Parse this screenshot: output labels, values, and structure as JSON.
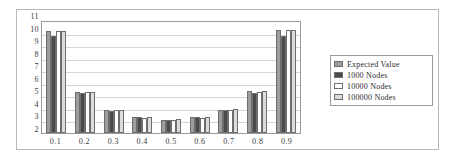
{
  "chart_data": {
    "type": "bar",
    "title": "",
    "subtitle": "",
    "xlabel": "",
    "ylabel": "",
    "categories": [
      "0.1",
      "0.2",
      "0.3",
      "0.4",
      "0.5",
      "0.6",
      "0.7",
      "0.8",
      "0.9"
    ],
    "ylim": [
      2,
      11
    ],
    "yticks": [
      "11",
      "10",
      "9",
      "8",
      "7",
      "6",
      "5",
      "4",
      "3",
      "2"
    ],
    "grid": true,
    "legend_position": "right",
    "series": [
      {
        "name": "Expected Value",
        "color": "#9d9d9d",
        "values": [
          10.1,
          5.3,
          3.8,
          3.25,
          3.05,
          3.25,
          3.85,
          5.35,
          10.2
        ]
      },
      {
        "name": "1000 Nodes",
        "color": "#4b4b4b",
        "values": [
          9.7,
          5.2,
          3.75,
          3.25,
          3.05,
          3.25,
          3.85,
          5.2,
          9.7
        ]
      },
      {
        "name": "10000 Nodes",
        "color": "#ffffff",
        "values": [
          10.15,
          5.3,
          3.8,
          3.2,
          3.05,
          3.2,
          3.85,
          5.3,
          10.2
        ]
      },
      {
        "name": "100000 Nodes",
        "color": "#dcdcdc",
        "values": [
          10.15,
          5.3,
          3.8,
          3.25,
          3.1,
          3.25,
          3.9,
          5.35,
          10.2
        ]
      }
    ]
  }
}
